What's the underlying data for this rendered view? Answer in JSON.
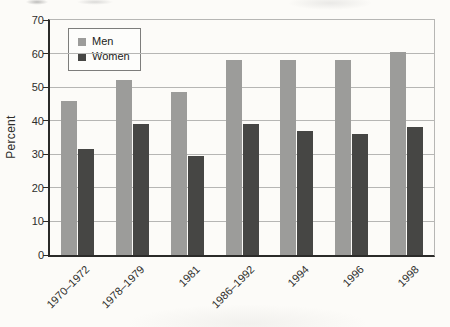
{
  "chart_data": {
    "type": "bar",
    "categories": [
      "1970–1972",
      "1978–1979",
      "1981",
      "1986–1992",
      "1994",
      "1996",
      "1998"
    ],
    "series": [
      {
        "name": "Men",
        "color": "#9c9c9a",
        "values": [
          46,
          52,
          48.5,
          58,
          58,
          58,
          60.5
        ]
      },
      {
        "name": "Women",
        "color": "#464644",
        "values": [
          31.5,
          39,
          29.5,
          39,
          37,
          36,
          38
        ]
      }
    ],
    "ylabel": "Percent",
    "ylim": [
      0,
      70
    ],
    "ytick_step": 10,
    "yticks": [
      0,
      10,
      20,
      30,
      40,
      50,
      60,
      70
    ],
    "grid": true,
    "legend_position": "upper-left-inside",
    "bar_width_px": 16
  },
  "colors": {
    "men_bar": "#9c9c9a",
    "women_bar": "#464644",
    "gridline": "#b6b6b4",
    "axis": "#2b2b29",
    "text": "#2e2e2c",
    "background": "#fcfbf8",
    "legend_background": "#fdfdfb",
    "legend_border": "#7d7d7b"
  }
}
